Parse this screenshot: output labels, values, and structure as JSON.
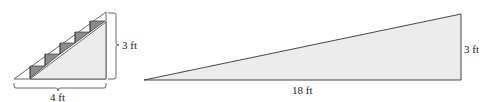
{
  "figures": [
    {
      "name": "staircase",
      "labels": {
        "height": "3 ft",
        "base": "4 ft"
      },
      "steps": 5
    },
    {
      "name": "ramp",
      "labels": {
        "height": "3 ft",
        "base": "18 ft"
      }
    }
  ],
  "colors": {
    "fill": "#ececec",
    "step_fill": "#8c8c8c",
    "stroke": "#333333"
  }
}
